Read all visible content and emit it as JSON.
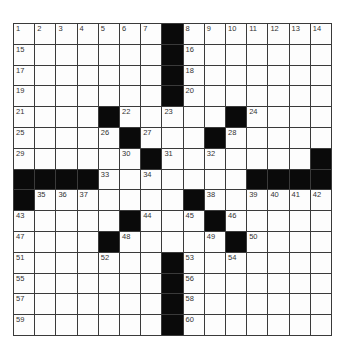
{
  "puzzle": {
    "rows": 15,
    "cols": 15,
    "grid": [
      [
        "1",
        "2",
        "3",
        "4",
        "5",
        "6",
        "7",
        "#",
        "8",
        "9",
        "10",
        "11",
        "12",
        "13",
        "14"
      ],
      [
        "15",
        "",
        "",
        "",
        "",
        "",
        "",
        "#",
        "16",
        "",
        "",
        "",
        "",
        "",
        ""
      ],
      [
        "17",
        "",
        "",
        "",
        "",
        "",
        "",
        "#",
        "18",
        "",
        "",
        "",
        "",
        "",
        ""
      ],
      [
        "19",
        "",
        "",
        "",
        "",
        "",
        "",
        "#",
        "20",
        "",
        "",
        "",
        "",
        "",
        ""
      ],
      [
        "21",
        "",
        "",
        "",
        "#",
        "22",
        "",
        "23",
        "",
        "",
        "#",
        "24",
        "",
        "",
        ""
      ],
      [
        "25",
        "",
        "",
        "",
        "26",
        "#",
        "27",
        "",
        "",
        "#",
        "28",
        "",
        "",
        "",
        ""
      ],
      [
        "29",
        "",
        "",
        "",
        "",
        "30",
        "#",
        "31",
        "",
        "32",
        "",
        "",
        "",
        "",
        "#"
      ],
      [
        "#",
        "#",
        "#",
        "#",
        "33",
        "",
        "34",
        "",
        "",
        "",
        "",
        "#",
        "#",
        "#",
        "#"
      ],
      [
        "#",
        "35",
        "36",
        "37",
        "",
        "",
        "",
        "",
        "#",
        "38",
        "",
        "39",
        "40",
        "41",
        "42"
      ],
      [
        "43",
        "",
        "",
        "",
        "",
        "#",
        "44",
        "",
        "45",
        "#",
        "46",
        "",
        "",
        "",
        ""
      ],
      [
        "47",
        "",
        "",
        "",
        "#",
        "48",
        "",
        "",
        "",
        "49",
        "#",
        "50",
        "",
        "",
        ""
      ],
      [
        "51",
        "",
        "",
        "",
        "52",
        "",
        "",
        "#",
        "53",
        "",
        "54",
        "",
        "",
        "",
        ""
      ],
      [
        "55",
        "",
        "",
        "",
        "",
        "",
        "",
        "#",
        "56",
        "",
        "",
        "",
        "",
        "",
        ""
      ],
      [
        "57",
        "",
        "",
        "",
        "",
        "",
        "",
        "#",
        "58",
        "",
        "",
        "",
        "",
        "",
        ""
      ],
      [
        "59",
        "",
        "",
        "",
        "",
        "",
        "",
        "#",
        "60",
        "",
        "",
        "",
        "",
        "",
        ""
      ]
    ],
    "colors": {
      "black_cell": "#0a0a0a",
      "white_cell": "#fdfdfd",
      "grid_line": "#3a3a3a"
    }
  }
}
